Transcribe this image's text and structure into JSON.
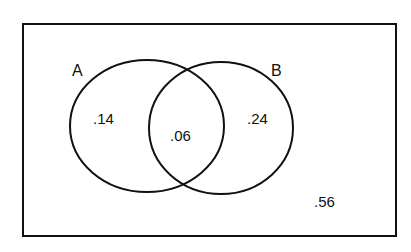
{
  "diagram": {
    "type": "venn",
    "universe": {
      "label": "",
      "region_value": ".56"
    },
    "sets": [
      {
        "name": "A",
        "label": "A",
        "only_value": ".14"
      },
      {
        "name": "B",
        "label": "B",
        "only_value": ".24"
      }
    ],
    "intersection": {
      "sets": [
        "A",
        "B"
      ],
      "value": ".06"
    },
    "colors": {
      "stroke": "#111111",
      "background": "#ffffff"
    }
  }
}
